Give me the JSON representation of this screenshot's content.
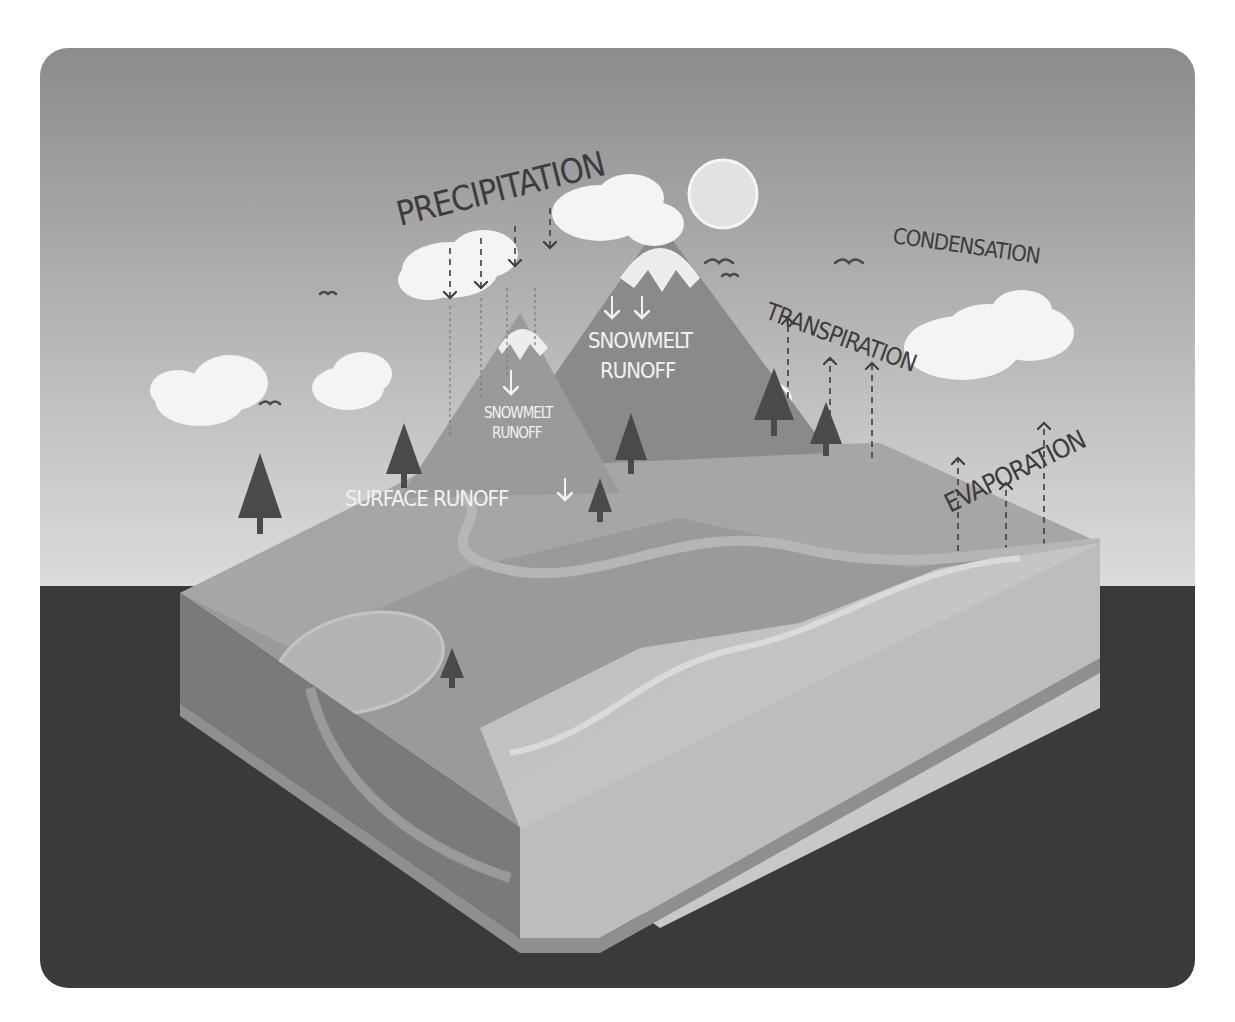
{
  "diagram": {
    "title_visible": false,
    "colors": {
      "sky_top": "#8a8a8a",
      "sky_bottom": "#d8d8d8",
      "ground": "#3a3a3a",
      "block_top": "#9a9a9a",
      "block_front_left": "#7a7a7a",
      "block_front_right": "#b8b8b8",
      "ocean": "#c4c4c4",
      "mountain": "#8c8c8c",
      "mountain_dark": "#7a7a7a",
      "snow": "#ececec",
      "cloud": "#f4f4f4",
      "tree": "#4a4a4a",
      "sun": "#e0e0e0",
      "label_dark": "#3c3c3c",
      "label_light": "#f2f2f2"
    },
    "labels": {
      "precipitation": "PRECIPITATION",
      "condensation": "CONDENSATION",
      "transpiration": "TRANSPIRATION",
      "evaporation": "EVAPORATION",
      "snowmelt_runoff_large_line1": "SNOWMELT",
      "snowmelt_runoff_large_line2": "RUNOFF",
      "snowmelt_runoff_small_line1": "SNOWMELT",
      "snowmelt_runoff_small_line2": "RUNOFF",
      "surface_runoff": "SURFACE RUNOFF"
    }
  }
}
